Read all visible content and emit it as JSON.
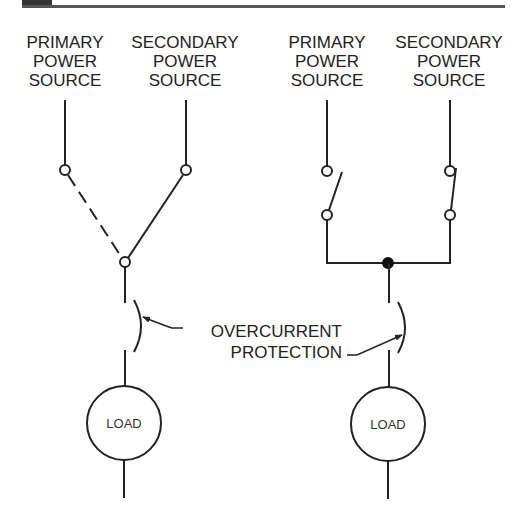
{
  "colors": {
    "line": "#222222",
    "header_bar": "#555555",
    "header_block": "#333333"
  },
  "left_diagram": {
    "source_labels": [
      {
        "lines": [
          "PRIMARY",
          "POWER",
          "SOURCE"
        ]
      },
      {
        "lines": [
          "SECONDARY",
          "POWER",
          "SOURCE"
        ]
      }
    ],
    "load_label": "LOAD"
  },
  "right_diagram": {
    "source_labels": [
      {
        "lines": [
          "PRIMARY",
          "POWER",
          "SOURCE"
        ]
      },
      {
        "lines": [
          "SECONDARY",
          "POWER",
          "SOURCE"
        ]
      }
    ],
    "load_label": "LOAD"
  },
  "callout": {
    "lines": [
      "OVERCURRENT",
      "PROTECTION"
    ]
  }
}
